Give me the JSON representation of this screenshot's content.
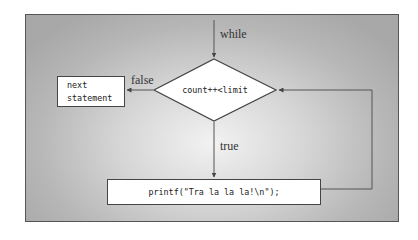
{
  "diagram": {
    "type": "flowchart",
    "colors": {
      "background_center": "#f2f2f2",
      "background_edge": "#a8a8a8",
      "frame_border": "#555555",
      "box_fill": "#ffffff",
      "line": "#555555"
    },
    "nodes": {
      "condition": {
        "shape": "diamond",
        "label": "count++<limit"
      },
      "body": {
        "shape": "rectangle",
        "label": "printf(\"Tra la la la!\\n\");"
      },
      "next": {
        "shape": "rectangle",
        "line1": "next",
        "line2": "statement"
      }
    },
    "edges": {
      "entry": {
        "label": "while",
        "to": "condition"
      },
      "false_edge": {
        "label": "false",
        "from": "condition",
        "to": "next"
      },
      "true_edge": {
        "label": "true",
        "from": "condition",
        "to": "body"
      },
      "loop_back": {
        "label": "",
        "from": "body",
        "to": "condition"
      }
    }
  }
}
